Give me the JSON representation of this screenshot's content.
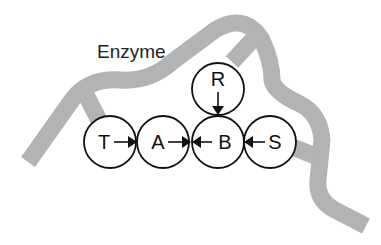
{
  "diagram": {
    "title": "Enzyme",
    "colors": {
      "enzyme_band": "#b3b3b3",
      "node_stroke": "#111111",
      "text": "#111111"
    },
    "nodes": [
      {
        "id": "T",
        "label": "T"
      },
      {
        "id": "A",
        "label": "A"
      },
      {
        "id": "B",
        "label": "B"
      },
      {
        "id": "S",
        "label": "S"
      },
      {
        "id": "R",
        "label": "R"
      }
    ],
    "edges": [
      {
        "from": "T",
        "to": "A"
      },
      {
        "from": "A",
        "to": "B"
      },
      {
        "from": "S",
        "to": "B"
      },
      {
        "from": "R",
        "to": "B"
      }
    ]
  }
}
